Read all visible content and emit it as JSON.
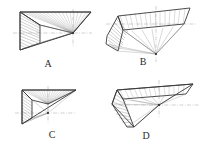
{
  "sheet": {
    "title": "Four perspective line drawings of hatched wedge solids",
    "background_color": "#ffffff",
    "line_color": "#3a3a3a",
    "hatch_color": "#777777",
    "centerline_color": "#9a9a9a",
    "width": 206,
    "height": 149,
    "layout": "2x2 grid of labeled figures"
  },
  "figures": [
    {
      "id": "A",
      "label": "A",
      "position": "top-left",
      "label_x": 48,
      "label_y": 67,
      "description": "L-shaped notched wedge in perspective with radiating hatch lines converging to a right-hand vanishing point, crossed by horizontal and vertical dash-dot centerlines",
      "apex_x": 73,
      "apex_y": 33,
      "centerline_h": {
        "x1": 12,
        "y1": 33,
        "x2": 92,
        "y2": 33
      },
      "centerline_v": {
        "x1": 73,
        "y1": 9,
        "x2": 73,
        "y2": 46
      }
    },
    {
      "id": "B",
      "label": "B",
      "position": "top-right",
      "label_x": 143,
      "label_y": 65,
      "description": "Trapezoidal tilted plate in perspective with fan of hatch lines converging to a low apex point, vertical dash-dot centerline through the apex",
      "apex_x": 156,
      "apex_y": 54,
      "centerline_h": {
        "x1": 104,
        "y1": 24,
        "x2": 196,
        "y2": 24
      },
      "centerline_v": {
        "x1": 156,
        "y1": 6,
        "x2": 156,
        "y2": 62
      }
    },
    {
      "id": "C",
      "label": "C",
      "position": "bottom-left",
      "label_x": 52,
      "label_y": 138,
      "description": "Compact L-shaped notched wedge in perspective with dense radiating hatch lines and crossing dash-dot centerlines",
      "apex_x": 48,
      "apex_y": 113,
      "centerline_h": {
        "x1": 14,
        "y1": 113,
        "x2": 74,
        "y2": 113
      },
      "centerline_v": {
        "x1": 48,
        "y1": 86,
        "x2": 48,
        "y2": 124
      }
    },
    {
      "id": "D",
      "label": "D",
      "position": "bottom-right",
      "label_x": 146,
      "label_y": 139,
      "description": "Elongated wedge in perspective sweeping to the right with a hatched fan on the lower left converging to a vanishing point, crossing dash-dot centerlines",
      "apex_x": 159,
      "apex_y": 105,
      "centerline_h": {
        "x1": 110,
        "y1": 105,
        "x2": 200,
        "y2": 105
      },
      "centerline_v": {
        "x1": 159,
        "y1": 80,
        "x2": 159,
        "y2": 118
      }
    }
  ]
}
